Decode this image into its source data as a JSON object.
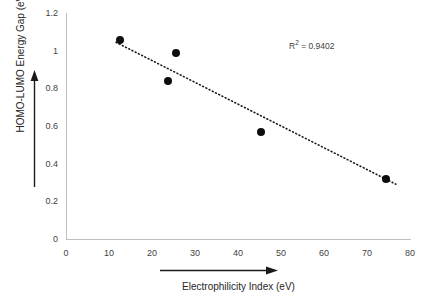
{
  "chart_data": {
    "type": "scatter",
    "title": "",
    "xlabel": "Electrophilicity Index (eV)",
    "ylabel": "HOMO-LUMO Energy Gap (eV)",
    "xlim": [
      0,
      80
    ],
    "ylim": [
      0,
      1.2
    ],
    "grid": false,
    "legend": "none",
    "x_ticks": [
      "0",
      "10",
      "20",
      "30",
      "40",
      "50",
      "60",
      "70",
      "80"
    ],
    "x_tick_values": [
      0,
      10,
      20,
      30,
      40,
      50,
      60,
      70,
      80
    ],
    "y_ticks": [
      "0",
      "0.2",
      "0.4",
      "0.6",
      "0.8",
      "1",
      "1.2"
    ],
    "y_tick_values": [
      0,
      0.2,
      0.4,
      0.6,
      0.8,
      1,
      1.2
    ],
    "series": [
      {
        "name": "HOMO-LUMO Energy Gap",
        "marker": "filled-circle",
        "marker_color": "#0d0d0d",
        "x": [
          12.4,
          23.7,
          25.6,
          45.1,
          74.3
        ],
        "y": [
          1.055,
          0.84,
          0.99,
          0.57,
          0.325
        ]
      }
    ],
    "trendline": {
      "style": "dotted",
      "color": "#1a1a1a",
      "x_start": 11.6,
      "y_start": 1.045,
      "x_end": 76.5,
      "y_end": 0.295,
      "r_squared": 0.9402
    },
    "annotations": [
      {
        "name": "r-squared",
        "prefix": "R",
        "superscript": "2",
        "text": " = 0.9402"
      }
    ],
    "axis_arrows": {
      "x": "right-arrow",
      "y": "up-arrow"
    },
    "colors": {
      "axis": "#bfbfbf",
      "tick_text": "#3f3f3f",
      "title_text": "#262626",
      "marker": "#0d0d0d",
      "trendline": "#1a1a1a",
      "arrow": "#1a1a1a",
      "background": "#ffffff"
    }
  }
}
